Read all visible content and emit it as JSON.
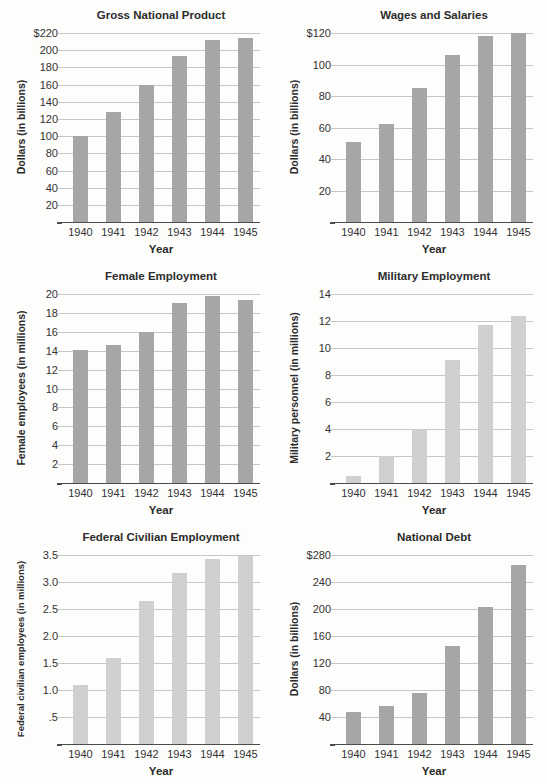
{
  "page": {
    "background": "#fdfdfc",
    "description_colors": {
      "bar_gray_dark": "#a6a6a6",
      "bar_gray_light": "#d0d0cf",
      "gridline": "#c7c7c6",
      "axis_line": "#4c4c4c",
      "text": "#2c2c2c"
    }
  },
  "chart_data": [
    {
      "type": "bar",
      "title": "Gross National Product",
      "xlabel": "Year",
      "ylabel": "Dollars (in billions)",
      "categories": [
        "1940",
        "1941",
        "1942",
        "1943",
        "1944",
        "1945"
      ],
      "values": [
        100,
        128,
        159,
        193,
        212,
        214
      ],
      "ylim": [
        0,
        220
      ],
      "yticks": [
        220,
        200,
        180,
        160,
        140,
        120,
        100,
        80,
        60,
        40,
        20
      ],
      "ytick_labels": [
        "$220",
        "200",
        "180",
        "160",
        "140",
        "120",
        "100",
        "80",
        "60",
        "40",
        "20"
      ],
      "bar_color": "#a6a6a6",
      "grid": true,
      "legend": null
    },
    {
      "type": "bar",
      "title": "Wages and Salaries",
      "xlabel": "Year",
      "ylabel": "Dollars (in billions)",
      "categories": [
        "1940",
        "1941",
        "1942",
        "1943",
        "1944",
        "1945"
      ],
      "values": [
        51,
        62,
        85,
        106,
        118,
        120
      ],
      "ylim": [
        0,
        120
      ],
      "yticks": [
        120,
        100,
        80,
        60,
        40,
        20
      ],
      "ytick_labels": [
        "$120",
        "100",
        "80",
        "60",
        "40",
        "20"
      ],
      "bar_color": "#a6a6a6",
      "grid": true,
      "legend": null
    },
    {
      "type": "bar",
      "title": "Female Employment",
      "xlabel": "Year",
      "ylabel": "Female employees (in millions)",
      "categories": [
        "1940",
        "1941",
        "1942",
        "1943",
        "1944",
        "1945"
      ],
      "values": [
        14.1,
        14.6,
        16.0,
        19.0,
        19.8,
        19.4
      ],
      "ylim": [
        0,
        20
      ],
      "yticks": [
        20,
        18,
        16,
        14,
        12,
        10,
        8,
        6,
        4,
        2
      ],
      "ytick_labels": [
        "20",
        "18",
        "16",
        "14",
        "12",
        "10",
        "8",
        "6",
        "4",
        "2"
      ],
      "bar_color": "#a6a6a6",
      "grid": true,
      "legend": null
    },
    {
      "type": "bar",
      "title": "Military Employment",
      "xlabel": "Year",
      "ylabel": "Military personnel (in millions)",
      "categories": [
        "1940",
        "1941",
        "1942",
        "1943",
        "1944",
        "1945"
      ],
      "values": [
        0.5,
        2.0,
        4.0,
        9.1,
        11.7,
        12.4
      ],
      "ylim": [
        0,
        14
      ],
      "yticks": [
        14,
        12,
        10,
        8,
        6,
        4,
        2
      ],
      "ytick_labels": [
        "14",
        "12",
        "10",
        "8",
        "6",
        "4",
        "2"
      ],
      "bar_color": "#d0d0cf",
      "grid": true,
      "legend": null
    },
    {
      "type": "bar",
      "title": "Federal Civilian Employment",
      "xlabel": "Year",
      "ylabel": "Federal civilian employees (in millions)",
      "categories": [
        "1940",
        "1941",
        "1942",
        "1943",
        "1944",
        "1945"
      ],
      "values": [
        1.1,
        1.6,
        2.65,
        3.17,
        3.42,
        3.48
      ],
      "ylim": [
        0,
        3.5
      ],
      "yticks": [
        3.5,
        3.0,
        2.5,
        2.0,
        1.5,
        1.0,
        0.5
      ],
      "ytick_labels": [
        "3.5",
        "3.0",
        "2.5",
        "2.0",
        "1.5",
        "1.0",
        ".5"
      ],
      "bar_color": "#d0d0cf",
      "grid": true,
      "legend": null
    },
    {
      "type": "bar",
      "title": "National Debt",
      "xlabel": "Year",
      "ylabel": "Dollars (in billions)",
      "categories": [
        "1940",
        "1941",
        "1942",
        "1943",
        "1944",
        "1945"
      ],
      "values": [
        47,
        56,
        76,
        145,
        203,
        265
      ],
      "ylim": [
        0,
        280
      ],
      "yticks": [
        280,
        240,
        200,
        160,
        120,
        80,
        40
      ],
      "ytick_labels": [
        "$280",
        "240",
        "200",
        "160",
        "120",
        "80",
        "40"
      ],
      "bar_color": "#a6a6a6",
      "grid": true,
      "legend": null
    }
  ]
}
